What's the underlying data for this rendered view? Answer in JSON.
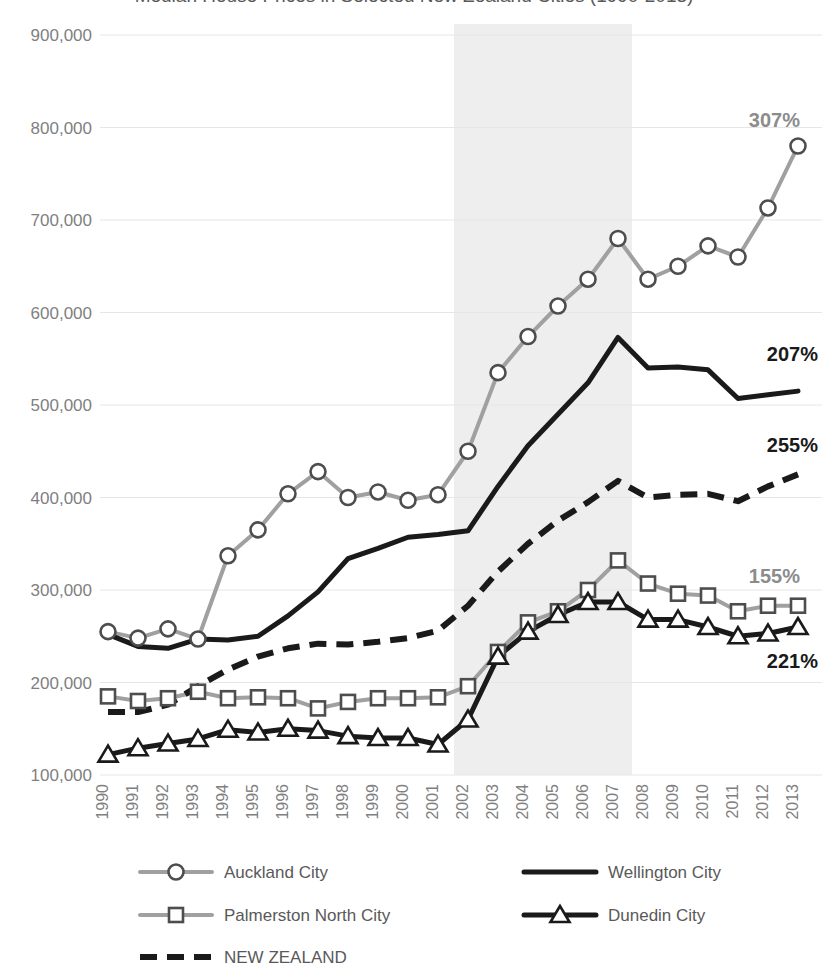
{
  "chart_data": {
    "type": "line",
    "title": "Median House Prices in Selected New Zealand Cities (1990-2013)",
    "xlabel": "",
    "ylabel": "",
    "x": [
      1990,
      1991,
      1992,
      1993,
      1994,
      1995,
      1996,
      1997,
      1998,
      1999,
      2000,
      2001,
      2002,
      2003,
      2004,
      2005,
      2006,
      2007,
      2008,
      2009,
      2010,
      2011,
      2012,
      2013
    ],
    "ylim": [
      100000,
      900000
    ],
    "ytick_labels": [
      "100,000",
      "200,000",
      "300,000",
      "400,000",
      "500,000",
      "600,000",
      "700,000",
      "800,000",
      "900,000"
    ],
    "ytick_values": [
      100000,
      200000,
      300000,
      400000,
      500000,
      600000,
      700000,
      800000,
      900000
    ],
    "grid": true,
    "legend_position": "bottom",
    "highlight_band": {
      "from": 2002,
      "to": 2007,
      "color": "#eeeeee",
      "label": ""
    },
    "series": [
      {
        "name": "Auckland City",
        "color": "#a0a0a0",
        "marker": "circle",
        "style": "solid",
        "end_label": "307%",
        "end_label_color": "#8c8c8c",
        "values": [
          255000,
          248000,
          258000,
          247000,
          337000,
          365000,
          404000,
          428000,
          400000,
          406000,
          397000,
          403000,
          450000,
          535000,
          574000,
          607000,
          636000,
          680000,
          636000,
          650000,
          672000,
          660000,
          713000,
          780000
        ]
      },
      {
        "name": "Wellington City",
        "color": "#1a1a1a",
        "marker": "none",
        "style": "solid",
        "end_label": "207%",
        "end_label_color": "#1a1a1a",
        "values": [
          252000,
          239000,
          237000,
          247000,
          246000,
          250000,
          272000,
          298000,
          334000,
          345000,
          357000,
          360000,
          364000,
          412000,
          456000,
          490000,
          524000,
          573000,
          540000,
          541000,
          538000,
          507000,
          511000,
          515000
        ]
      },
      {
        "name": "Palmerston North City",
        "color": "#a0a0a0",
        "marker": "square",
        "style": "solid",
        "end_label": "155%",
        "end_label_color": "#8c8c8c",
        "values": [
          185000,
          180000,
          183000,
          190000,
          183000,
          184000,
          183000,
          172000,
          179000,
          183000,
          183000,
          184000,
          196000,
          233000,
          265000,
          277000,
          300000,
          332000,
          307000,
          296000,
          294000,
          277000,
          283000,
          283000
        ]
      },
      {
        "name": "Dunedin City",
        "color": "#1a1a1a",
        "marker": "triangle",
        "style": "solid",
        "end_label": "221%",
        "end_label_color": "#1a1a1a",
        "values": [
          122000,
          129000,
          134000,
          139000,
          149000,
          146000,
          150000,
          148000,
          142000,
          140000,
          140000,
          133000,
          160000,
          228000,
          255000,
          273000,
          287000,
          287000,
          268000,
          268000,
          260000,
          250000,
          253000,
          260000
        ]
      },
      {
        "name": "NEW ZEALAND",
        "color": "#1a1a1a",
        "marker": "none",
        "style": "dashed",
        "end_label": "255%",
        "end_label_color": "#1a1a1a",
        "values": [
          168000,
          168000,
          176000,
          196000,
          214000,
          228000,
          237000,
          242000,
          241000,
          244000,
          248000,
          256000,
          283000,
          320000,
          350000,
          375000,
          395000,
          418000,
          400000,
          403000,
          404000,
          396000,
          412000,
          425000
        ]
      }
    ]
  },
  "legend": {
    "items": [
      {
        "label": "Auckland City",
        "marker": "circle",
        "color": "#a0a0a0",
        "style": "solid"
      },
      {
        "label": "Wellington City",
        "marker": "none",
        "color": "#1a1a1a",
        "style": "solid"
      },
      {
        "label": "Palmerston North City",
        "marker": "square",
        "color": "#a0a0a0",
        "style": "solid"
      },
      {
        "label": "Dunedin City",
        "marker": "triangle",
        "color": "#1a1a1a",
        "style": "solid"
      },
      {
        "label": "NEW ZEALAND",
        "marker": "none",
        "color": "#1a1a1a",
        "style": "dashed"
      }
    ]
  }
}
